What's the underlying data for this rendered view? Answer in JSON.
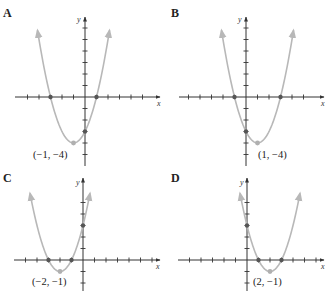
{
  "chart_data": [
    {
      "type": "line",
      "panel": "A",
      "title": "A",
      "function": "y = (x + 1)^2 - 4",
      "vertex": {
        "x": -1,
        "y": -4,
        "label": "(−1, −4)"
      },
      "x_intercepts": [
        -3,
        1
      ],
      "y_intercept": -3,
      "xlabel": "x",
      "ylabel": "y",
      "xlim": [
        -6,
        6
      ],
      "ylim": [
        -6,
        6
      ],
      "x_ticks": [
        -5,
        -4,
        -3,
        -2,
        -1,
        1,
        2,
        3,
        4,
        5
      ],
      "y_ticks": [
        -5,
        -4,
        -3,
        -2,
        -1,
        1,
        2,
        3,
        4,
        5,
        6
      ],
      "grid": false,
      "origin_px": [
        85,
        97
      ],
      "unit_px": 11.5,
      "y_axis_px": [
        17,
        166
      ],
      "x_axis_px": [
        15,
        160
      ],
      "curve_top_y": 5.8
    },
    {
      "type": "line",
      "panel": "B",
      "title": "B",
      "function": "y = (x - 1)^2 - 4",
      "vertex": {
        "x": 1,
        "y": -4,
        "label": "(1, −4)"
      },
      "x_intercepts": [
        -1,
        3
      ],
      "y_intercept": -3,
      "xlabel": "x",
      "ylabel": "y",
      "xlim": [
        -6,
        6
      ],
      "ylim": [
        -6,
        6
      ],
      "x_ticks": [
        -5,
        -4,
        -3,
        -2,
        -1,
        1,
        2,
        3,
        4,
        5
      ],
      "y_ticks": [
        -5,
        -4,
        -3,
        -2,
        -1,
        1,
        2,
        3,
        4,
        5,
        6
      ],
      "grid": false,
      "origin_px": [
        246,
        97
      ],
      "unit_px": 11.5,
      "y_axis_px": [
        17,
        166
      ],
      "x_axis_px": [
        179,
        324
      ],
      "curve_top_y": 5.8
    },
    {
      "type": "line",
      "panel": "C",
      "title": "C",
      "function": "y = (x + 2)^2 - 1",
      "vertex": {
        "x": -2,
        "y": -1,
        "label": "(−2, −1)"
      },
      "x_intercepts": [
        -3,
        -1
      ],
      "y_intercept": 3,
      "xlabel": "x",
      "ylabel": "y",
      "xlim": [
        -6,
        6
      ],
      "ylim": [
        -3,
        6
      ],
      "x_ticks": [
        -5,
        -4,
        -3,
        -2,
        -1,
        1,
        2,
        3,
        4,
        5,
        6
      ],
      "y_ticks": [
        -2,
        -1,
        1,
        2,
        3,
        4,
        5
      ],
      "grid": false,
      "origin_px": [
        83,
        260
      ],
      "unit_px": 11.5,
      "y_axis_px": [
        178,
        291
      ],
      "x_axis_px": [
        14,
        160
      ],
      "curve_top_y": 5.8
    },
    {
      "type": "line",
      "panel": "D",
      "title": "D",
      "function": "y = (x - 2)^2 - 1",
      "vertex": {
        "x": 2,
        "y": -1,
        "label": "(2, −1)"
      },
      "x_intercepts": [
        1,
        3
      ],
      "y_intercept": 3,
      "xlabel": "x",
      "ylabel": "y",
      "xlim": [
        -6,
        6
      ],
      "ylim": [
        -3,
        6
      ],
      "x_ticks": [
        -5,
        -4,
        -3,
        -2,
        -1,
        1,
        2,
        3,
        4,
        5,
        6
      ],
      "y_ticks": [
        -2,
        -1,
        1,
        2,
        3,
        4,
        5
      ],
      "grid": false,
      "origin_px": [
        247,
        260
      ],
      "unit_px": 11.5,
      "y_axis_px": [
        178,
        291
      ],
      "x_axis_px": [
        178,
        324
      ],
      "curve_top_y": 5.8
    }
  ],
  "panels": {
    "A": {
      "letter": "A",
      "vertex_label": "(−1, −4)",
      "x_axis_label": "x",
      "y_axis_label": "y"
    },
    "B": {
      "letter": "B",
      "vertex_label": "(1, −4)",
      "x_axis_label": "x",
      "y_axis_label": "y"
    },
    "C": {
      "letter": "C",
      "vertex_label": "(−2, −1)",
      "x_axis_label": "x",
      "y_axis_label": "y"
    },
    "D": {
      "letter": "D",
      "vertex_label": "(2, −1)",
      "x_axis_label": "x",
      "y_axis_label": "y"
    }
  },
  "colors": {
    "axis": "#333333",
    "curve": "#b8b8b8",
    "intercept_dot": "#555555",
    "vertex_dot": "#b0b0b0",
    "text": "#222222"
  }
}
